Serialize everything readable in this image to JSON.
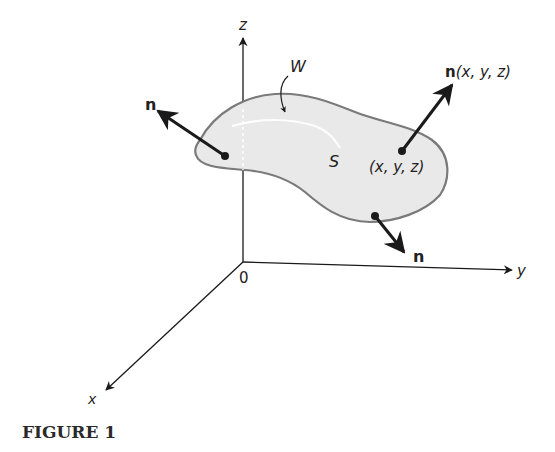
{
  "figure": {
    "caption": "FIGURE 1",
    "axes": {
      "z_label": "z",
      "y_label": "y",
      "x_label": "x",
      "origin_label": "0"
    },
    "region_label": "W",
    "surface_label": "S",
    "point_label": "(x, y, z)",
    "normal_label": "n",
    "normal_at_point_bold": "n",
    "normal_at_point_args": "(x, y, z)",
    "colors": {
      "surface_fill": "#e9e9e9",
      "surface_stroke": "#7a7a7a",
      "ink": "#1a1a1a"
    }
  }
}
